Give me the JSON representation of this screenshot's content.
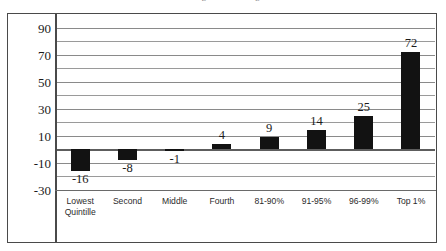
{
  "chart_data": {
    "type": "bar",
    "title": "Share of Congressional Budget Office",
    "title_visible": false,
    "title_note": "cut off at top edge of image",
    "categories": [
      "Lowest\nQuintille",
      "Second",
      "Middle",
      "Fourth",
      "81-90%",
      "91-95%",
      "96-99%",
      "Top 1%"
    ],
    "values": [
      -16,
      -8,
      -1,
      4,
      9,
      14,
      25,
      72
    ],
    "data_labels": [
      "-16",
      "-8",
      "-1",
      "4",
      "9",
      "14",
      "25",
      "72"
    ],
    "xlabel": "",
    "ylabel": "",
    "ylim": [
      -30,
      100
    ],
    "ytick_labels": [
      "90",
      "70",
      "50",
      "30",
      "10",
      "-10",
      "-30"
    ],
    "ytick_values": [
      90,
      70,
      50,
      30,
      10,
      -10,
      -30
    ],
    "gridline_values": [
      90,
      80,
      70,
      60,
      50,
      40,
      30,
      20,
      10,
      -10,
      -20,
      -30
    ],
    "zero_line": 0,
    "grid": true,
    "legend": "none",
    "bar_color": "#121212",
    "gridline_color": "#9a9a9a",
    "axis_color": "#4a4a4a",
    "background": "#ffffff"
  }
}
